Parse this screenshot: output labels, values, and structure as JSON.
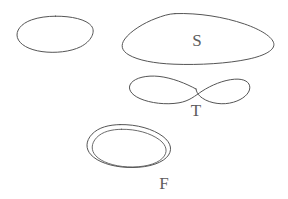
{
  "canvas": {
    "width": 288,
    "height": 199,
    "background_color": "#ffffff",
    "stroke_color": "#555555",
    "label_color": "#5d5d5d"
  },
  "diagram": {
    "style": "hand-drawn pen sketch, thin dark-gray outlines on white",
    "shape_count": 4,
    "label_count": 3,
    "shapes": [
      {
        "id": "shape-1",
        "name": "unlabeled-ellipse",
        "kind": "simple closed curve (ellipse)",
        "label": "",
        "crossings": 0,
        "contours": 1,
        "bounds": {
          "x": 17,
          "y": 16,
          "width": 76,
          "height": 37
        },
        "center": {
          "x": 55,
          "y": 34
        }
      },
      {
        "id": "shape-2",
        "name": "large-blob-s",
        "kind": "simple closed curve (large irregular oval)",
        "label": "S",
        "crossings": 0,
        "contours": 1,
        "bounds": {
          "x": 122,
          "y": 13,
          "width": 152,
          "height": 52
        },
        "center": {
          "x": 198,
          "y": 39
        },
        "label_position": {
          "x": 197,
          "y": 46
        }
      },
      {
        "id": "shape-3",
        "name": "figure-eight-t",
        "kind": "figure-eight (lemniscate) with one self-crossing",
        "label": "T",
        "crossings": 1,
        "contours": 1,
        "bounds": {
          "x": 130,
          "y": 76,
          "width": 120,
          "height": 30
        },
        "crossing_point": {
          "x": 196,
          "y": 89
        },
        "label_position": {
          "x": 196,
          "y": 116
        }
      },
      {
        "id": "shape-4",
        "name": "double-loop-f",
        "kind": "doubled / spiral closed curve (two nested contours)",
        "label": "F",
        "crossings": 0,
        "contours": 2,
        "bounds": {
          "x": 87,
          "y": 124,
          "width": 85,
          "height": 44
        },
        "center": {
          "x": 128,
          "y": 146
        },
        "label_position": {
          "x": 164,
          "y": 189
        }
      }
    ],
    "labels": [
      {
        "id": "label-s",
        "text": "S",
        "for_shape": "shape-2",
        "placement": "inside"
      },
      {
        "id": "label-t",
        "text": "T",
        "for_shape": "shape-3",
        "placement": "below-crossing"
      },
      {
        "id": "label-f",
        "text": "F",
        "for_shape": "shape-4",
        "placement": "below-right"
      }
    ]
  }
}
